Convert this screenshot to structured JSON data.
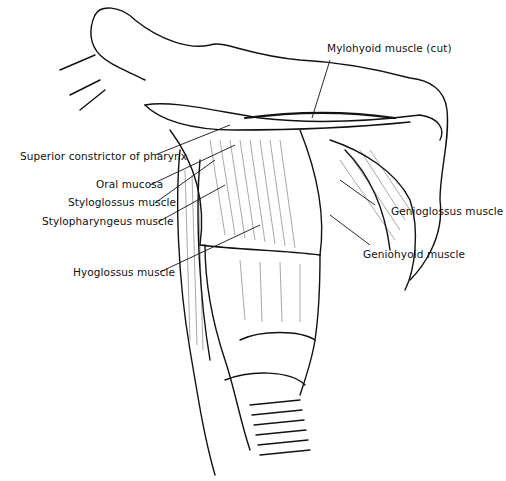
{
  "figure": {
    "labels": {
      "mylohyoid": "Mylohyoid muscle (cut)",
      "superior_constrictor": "Superior constrictor of pharynx",
      "oral_mucosa": "Oral mucosa",
      "styloglossus": "Styloglossus muscle",
      "stylopharyngeus": "Stylopharyngeus muscle",
      "hyoglossus": "Hyoglossus muscle",
      "genioglossus": "Genioglossus muscle",
      "geniohyoid": "Geniohyoid muscle"
    }
  }
}
